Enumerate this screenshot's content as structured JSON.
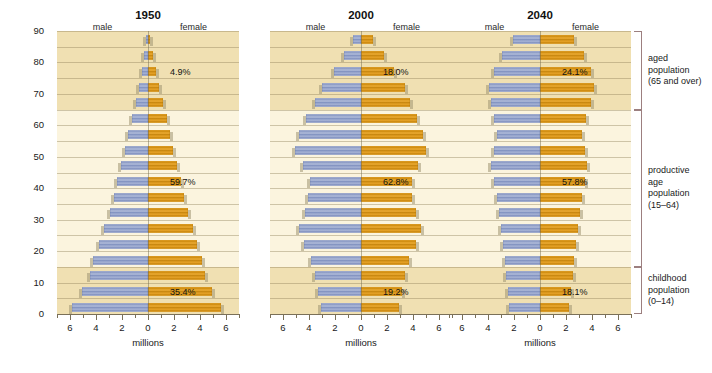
{
  "axis": {
    "y_title": "a g e   o f   p o p u l a t i o n",
    "y_ticks": [
      "90",
      "80",
      "70",
      "60",
      "50",
      "40",
      "30",
      "20",
      "10",
      "0"
    ],
    "x_ticks": [
      "6",
      "4",
      "2",
      "0",
      "2",
      "4",
      "6"
    ],
    "x_unit": "millions",
    "x_max": 7
  },
  "brackets": [
    {
      "id": "aged",
      "line1": "aged",
      "line2": "population",
      "line3": "(65 and over)",
      "age_from": 65,
      "age_to": 90
    },
    {
      "id": "productive",
      "line1": "productive",
      "line2": "age",
      "line3": "population",
      "line4": "(15–64)",
      "age_from": 15,
      "age_to": 65
    },
    {
      "id": "childhood",
      "line1": "childhood",
      "line2": "population",
      "line3": "(0–14)",
      "age_from": 0,
      "age_to": 15
    }
  ],
  "labels": {
    "male": "male",
    "female": "female"
  },
  "chart_data": {
    "type": "bar",
    "chart_style": "population-pyramid",
    "title": "",
    "xlabel": "millions",
    "ylabel": "age of population",
    "xlim": [
      -7,
      7
    ],
    "ylim": [
      0,
      90
    ],
    "grid": true,
    "legend": [
      "male",
      "female"
    ],
    "legend_position": "top",
    "age_groups": [
      "0–4",
      "5–9",
      "10–14",
      "15–19",
      "20–24",
      "25–29",
      "30–34",
      "35–39",
      "40–44",
      "45–49",
      "50–54",
      "55–59",
      "60–64",
      "65–69",
      "70–74",
      "75–79",
      "80–84",
      "85–89",
      "90+"
    ],
    "age_starts": [
      0,
      5,
      10,
      15,
      20,
      25,
      30,
      35,
      40,
      45,
      50,
      55,
      60,
      65,
      70,
      75,
      80,
      85,
      90
    ],
    "panels": [
      {
        "year": "1950",
        "male_label": "male",
        "female_label": "female",
        "male": [
          5.85,
          5.05,
          4.45,
          4.2,
          3.75,
          3.35,
          2.9,
          2.65,
          2.35,
          2.05,
          1.8,
          1.55,
          1.25,
          0.95,
          0.7,
          0.45,
          0.28,
          0.14,
          0.06
        ],
        "female": [
          5.65,
          4.9,
          4.35,
          4.15,
          3.8,
          3.45,
          3.05,
          2.8,
          2.5,
          2.2,
          1.95,
          1.7,
          1.45,
          1.15,
          0.88,
          0.58,
          0.36,
          0.18,
          0.08
        ],
        "annotations": [
          {
            "text": "4.9%",
            "group": "aged",
            "at_age": 77
          },
          {
            "text": "59.7%",
            "group": "productive",
            "at_age": 42
          },
          {
            "text": "35.4%",
            "group": "childhood",
            "at_age": 7
          }
        ]
      },
      {
        "year": "2000",
        "male_label": "male",
        "female_label": "female",
        "male": [
          3.05,
          3.3,
          3.55,
          3.85,
          4.35,
          4.75,
          4.3,
          4.05,
          3.95,
          4.45,
          5.05,
          4.75,
          4.2,
          3.55,
          3.0,
          2.05,
          1.3,
          0.6,
          0.18
        ],
        "female": [
          2.9,
          3.15,
          3.4,
          3.7,
          4.2,
          4.6,
          4.2,
          3.95,
          3.9,
          4.4,
          5.0,
          4.75,
          4.3,
          3.8,
          3.4,
          2.55,
          1.8,
          0.95,
          0.35
        ],
        "annotations": [
          {
            "text": "18.0%",
            "group": "aged",
            "at_age": 77
          },
          {
            "text": "62.8%",
            "group": "productive",
            "at_age": 42
          },
          {
            "text": "19.2%",
            "group": "childhood",
            "at_age": 7
          }
        ]
      },
      {
        "year": "2040",
        "male_label": "male",
        "female_label": "female",
        "male": [
          2.35,
          2.45,
          2.6,
          2.7,
          2.85,
          3.0,
          3.15,
          3.3,
          3.55,
          3.75,
          3.55,
          3.3,
          3.55,
          3.8,
          3.95,
          3.55,
          2.95,
          2.05,
          1.05
        ],
        "female": [
          2.25,
          2.35,
          2.5,
          2.6,
          2.75,
          2.9,
          3.05,
          3.2,
          3.45,
          3.65,
          3.45,
          3.25,
          3.55,
          3.9,
          4.15,
          3.9,
          3.4,
          2.6,
          1.5
        ],
        "annotations": [
          {
            "text": "24.1%",
            "group": "aged",
            "at_age": 77
          },
          {
            "text": "57.8%",
            "group": "productive",
            "at_age": 42
          },
          {
            "text": "18.1%",
            "group": "childhood",
            "at_age": 7
          }
        ]
      }
    ]
  },
  "colors": {
    "male_bar": "#8d9cc6",
    "female_bar": "#d08e12",
    "band_aged": "#f0e0b2",
    "band_productive": "#fbf4de",
    "band_childhood": "#f0e0b2",
    "bracket": "#9c7f7f",
    "text": "#1a1a1a"
  }
}
